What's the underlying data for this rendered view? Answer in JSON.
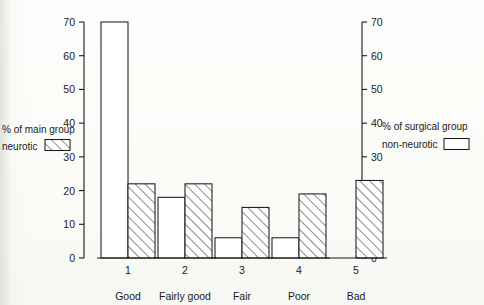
{
  "chart_data": {
    "type": "bar",
    "title": "",
    "subtitle": "",
    "xlabel": "",
    "ylabel": "",
    "ylim": [
      0,
      70
    ],
    "y_ticks": [
      0,
      10,
      20,
      30,
      40,
      50,
      60,
      70
    ],
    "right_axis": {
      "label": "",
      "ylim": [
        0,
        70
      ],
      "ticks": [
        0,
        10,
        20,
        30,
        40,
        50,
        60,
        70
      ]
    },
    "grid": false,
    "categories": [
      "1",
      "2",
      "3",
      "4",
      "5"
    ],
    "category_names": [
      "Good",
      "Fairly good",
      "Fair",
      "Poor",
      "Bad"
    ],
    "series": [
      {
        "name": "non-neurotic",
        "axis": "right",
        "group": "% of surgical group",
        "style": "open",
        "values": [
          70,
          18,
          6,
          6,
          0
        ]
      },
      {
        "name": "neurotic",
        "axis": "left",
        "group": "% of main group",
        "style": "hatched",
        "values": [
          22,
          22,
          15,
          19,
          23
        ]
      }
    ],
    "legend_position": "left-and-right",
    "colors": {
      "ink": "#1b1b1b",
      "open_fill": "#ffffff",
      "paper": "#fdfdfb"
    }
  },
  "legend_left": {
    "title": "% of main group",
    "entry_label": "neurotic",
    "swatch": "hatched-swatch"
  },
  "legend_right": {
    "title": "% of surgical group",
    "entry_label": "non-neurotic",
    "swatch": "open-swatch"
  },
  "axis_left": {
    "ticks": [
      "0",
      "10",
      "20",
      "30",
      "40",
      "50",
      "60",
      "70"
    ]
  },
  "axis_right": {
    "ticks": [
      "0",
      "10",
      "20",
      "30",
      "40",
      "50",
      "60",
      "70"
    ]
  },
  "categories": {
    "numbers": [
      "1",
      "2",
      "3",
      "4",
      "5"
    ],
    "names": [
      "Good",
      "Fairly good",
      "Fair",
      "Poor",
      "Bad"
    ]
  }
}
